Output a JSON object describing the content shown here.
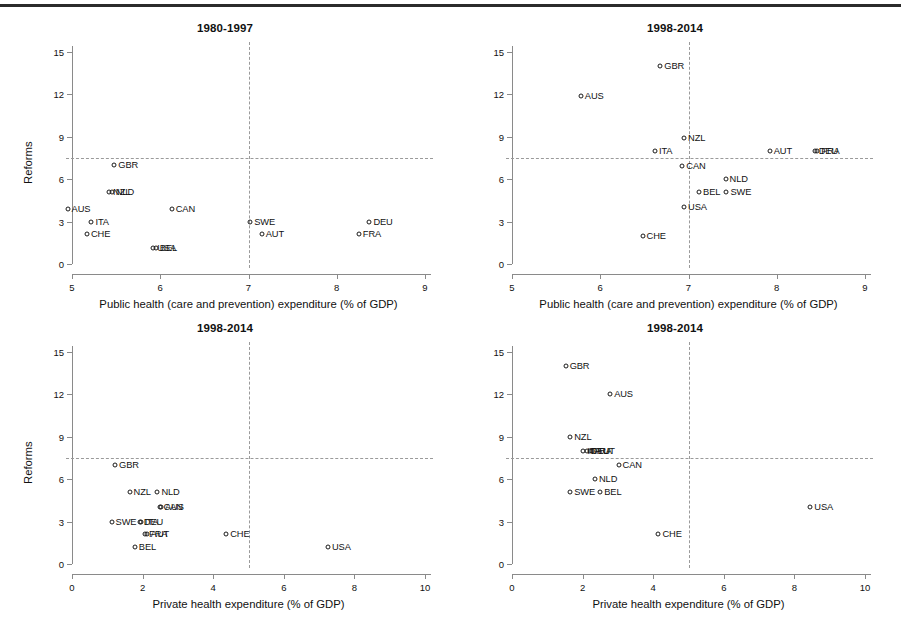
{
  "figure": {
    "background": "#ffffff",
    "rule_color": "#2b2b2b",
    "marker_color": "#1a1a1a",
    "refline_color": "#9a9a9a",
    "axis_color": "#8a8a8a"
  },
  "axis_titles": {
    "y": "Reforms",
    "x_public": "Public health (care and prevention) expenditure (% of GDP)",
    "x_private": "Private health expenditure (% of GDP)"
  },
  "chart_data": [
    {
      "id": "panel-top-left",
      "type": "scatter",
      "title": "1980-1997",
      "xlabel": "Public health (care and prevention) expenditure (% of GDP)",
      "ylabel": "Reforms",
      "xlim": [
        5,
        9
      ],
      "ylim": [
        0,
        15
      ],
      "xticks": [
        5,
        6,
        7,
        8,
        9
      ],
      "yticks": [
        0,
        3,
        6,
        9,
        12,
        15
      ],
      "grid": false,
      "reference_lines": {
        "horizontal": 7.5,
        "vertical": 7.0
      },
      "points": [
        {
          "label": "GBR",
          "x": 5.48,
          "y": 7.0
        },
        {
          "label": "NZL",
          "x": 5.42,
          "y": 5.1
        },
        {
          "label": "NLD",
          "x": 5.45,
          "y": 5.1
        },
        {
          "label": "AUS",
          "x": 4.95,
          "y": 3.9
        },
        {
          "label": "CAN",
          "x": 6.13,
          "y": 3.9
        },
        {
          "label": "ITA",
          "x": 5.22,
          "y": 3.0
        },
        {
          "label": "SWE",
          "x": 7.02,
          "y": 3.0
        },
        {
          "label": "DEU",
          "x": 8.37,
          "y": 3.0
        },
        {
          "label": "CHE",
          "x": 5.17,
          "y": 2.1
        },
        {
          "label": "AUT",
          "x": 7.15,
          "y": 2.1
        },
        {
          "label": "FRA",
          "x": 8.25,
          "y": 2.1
        },
        {
          "label": "USA",
          "x": 5.92,
          "y": 1.1
        },
        {
          "label": "BEL",
          "x": 5.95,
          "y": 1.1
        }
      ]
    },
    {
      "id": "panel-top-right",
      "type": "scatter",
      "title": "1998-2014",
      "xlabel": "Public health (care and prevention) expenditure (% of GDP)",
      "ylabel": "Reforms",
      "xlim": [
        5,
        9
      ],
      "ylim": [
        0,
        15
      ],
      "xticks": [
        5,
        6,
        7,
        8,
        9
      ],
      "yticks": [
        0,
        3,
        6,
        9,
        12,
        15
      ],
      "grid": false,
      "reference_lines": {
        "horizontal": 7.5,
        "vertical": 7.0
      },
      "points": [
        {
          "label": "GBR",
          "x": 6.68,
          "y": 14.0
        },
        {
          "label": "AUS",
          "x": 5.78,
          "y": 11.9
        },
        {
          "label": "NZL",
          "x": 6.95,
          "y": 8.9
        },
        {
          "label": "ITA",
          "x": 6.62,
          "y": 8.0
        },
        {
          "label": "AUT",
          "x": 7.92,
          "y": 8.0
        },
        {
          "label": "DEU",
          "x": 8.43,
          "y": 8.0
        },
        {
          "label": "FRA",
          "x": 8.46,
          "y": 8.0
        },
        {
          "label": "CAN",
          "x": 6.93,
          "y": 6.9
        },
        {
          "label": "NLD",
          "x": 7.42,
          "y": 6.0
        },
        {
          "label": "BEL",
          "x": 7.12,
          "y": 5.1
        },
        {
          "label": "SWE",
          "x": 7.43,
          "y": 5.1
        },
        {
          "label": "USA",
          "x": 6.95,
          "y": 4.0
        },
        {
          "label": "CHE",
          "x": 6.48,
          "y": 2.0
        }
      ]
    },
    {
      "id": "panel-bottom-left",
      "type": "scatter",
      "title": "1998-2014",
      "xlabel": "Private health expenditure (% of GDP)",
      "ylabel": "Reforms",
      "xlim": [
        0,
        10
      ],
      "ylim": [
        0,
        15
      ],
      "xticks": [
        0,
        2,
        4,
        6,
        8,
        10
      ],
      "yticks": [
        0,
        3,
        6,
        9,
        12,
        15
      ],
      "grid": false,
      "reference_lines": {
        "horizontal": 7.5,
        "vertical": 5.0
      },
      "points": [
        {
          "label": "GBR",
          "x": 1.22,
          "y": 7.0
        },
        {
          "label": "NZL",
          "x": 1.63,
          "y": 5.1
        },
        {
          "label": "NLD",
          "x": 2.42,
          "y": 5.1
        },
        {
          "label": "CAN",
          "x": 2.48,
          "y": 4.0
        },
        {
          "label": "AUS",
          "x": 2.52,
          "y": 4.0
        },
        {
          "label": "SWE",
          "x": 1.12,
          "y": 3.0
        },
        {
          "label": "DEU",
          "x": 1.92,
          "y": 3.0
        },
        {
          "label": "ITA",
          "x": 1.95,
          "y": 3.0
        },
        {
          "label": "FRA",
          "x": 2.07,
          "y": 2.1
        },
        {
          "label": "AUT",
          "x": 2.12,
          "y": 2.1
        },
        {
          "label": "CHE",
          "x": 4.37,
          "y": 2.1
        },
        {
          "label": "BEL",
          "x": 1.78,
          "y": 1.2
        },
        {
          "label": "USA",
          "x": 7.25,
          "y": 1.2
        }
      ]
    },
    {
      "id": "panel-bottom-right",
      "type": "scatter",
      "title": "1998-2014",
      "xlabel": "Private health expenditure (% of GDP)",
      "ylabel": "Reforms",
      "xlim": [
        0,
        10
      ],
      "ylim": [
        0,
        15
      ],
      "xticks": [
        0,
        2,
        4,
        6,
        8,
        10
      ],
      "yticks": [
        0,
        3,
        6,
        9,
        12,
        15
      ],
      "grid": false,
      "reference_lines": {
        "horizontal": 7.5,
        "vertical": 5.0
      },
      "points": [
        {
          "label": "GBR",
          "x": 1.52,
          "y": 14.0
        },
        {
          "label": "AUS",
          "x": 2.78,
          "y": 12.0
        },
        {
          "label": "NZL",
          "x": 1.65,
          "y": 9.0
        },
        {
          "label": "ITA",
          "x": 2.02,
          "y": 8.0
        },
        {
          "label": "DEU",
          "x": 2.12,
          "y": 8.0
        },
        {
          "label": "FRA",
          "x": 2.2,
          "y": 8.0
        },
        {
          "label": "AUT",
          "x": 2.28,
          "y": 8.0
        },
        {
          "label": "CAN",
          "x": 3.02,
          "y": 7.0
        },
        {
          "label": "NLD",
          "x": 2.35,
          "y": 6.0
        },
        {
          "label": "SWE",
          "x": 1.65,
          "y": 5.1
        },
        {
          "label": "BEL",
          "x": 2.5,
          "y": 5.1
        },
        {
          "label": "USA",
          "x": 8.45,
          "y": 4.0
        },
        {
          "label": "CHE",
          "x": 4.15,
          "y": 2.1
        }
      ]
    }
  ]
}
